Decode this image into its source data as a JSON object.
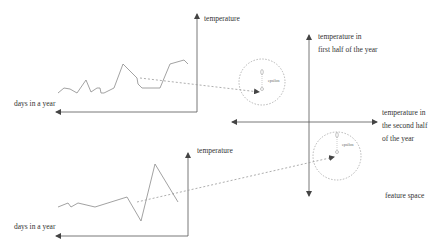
{
  "colors": {
    "axis": "#555555",
    "series": "#8a8a8a",
    "dashed": "#999999",
    "text": "#333333"
  },
  "top_chart": {
    "y_label": "temperature",
    "x_label": "days in a year",
    "series_points": [
      [
        58,
        93
      ],
      [
        64,
        88
      ],
      [
        70,
        89
      ],
      [
        77,
        93
      ],
      [
        86,
        80
      ],
      [
        91,
        92
      ],
      [
        97,
        88
      ],
      [
        100,
        88
      ],
      [
        101,
        93
      ],
      [
        104,
        93
      ],
      [
        114,
        88
      ],
      [
        123,
        64
      ],
      [
        137,
        78
      ],
      [
        138,
        84
      ],
      [
        142,
        88
      ],
      [
        160,
        88
      ],
      [
        170,
        64
      ],
      [
        184,
        60
      ],
      [
        188,
        64
      ]
    ]
  },
  "bottom_chart": {
    "y_label": "temperature",
    "x_label": "days in a year",
    "series_points": [
      [
        58,
        207
      ],
      [
        68,
        203
      ],
      [
        71,
        207
      ],
      [
        78,
        203
      ],
      [
        95,
        207
      ],
      [
        127,
        197
      ],
      [
        141,
        221
      ],
      [
        155,
        164
      ],
      [
        178,
        202
      ]
    ]
  },
  "feature_space": {
    "y_label_line1": "temperature in",
    "y_label_line2": "first half of the year",
    "x_label_line1": "temperature in",
    "x_label_line2": "the second half",
    "x_label_line3": "of the year",
    "caption": "feature space",
    "circles": [
      {
        "label": "epsilon",
        "cx": 262,
        "cy": 82,
        "r": 23
      },
      {
        "label": "epsilon",
        "cx": 337,
        "cy": 156,
        "r": 24
      }
    ]
  }
}
